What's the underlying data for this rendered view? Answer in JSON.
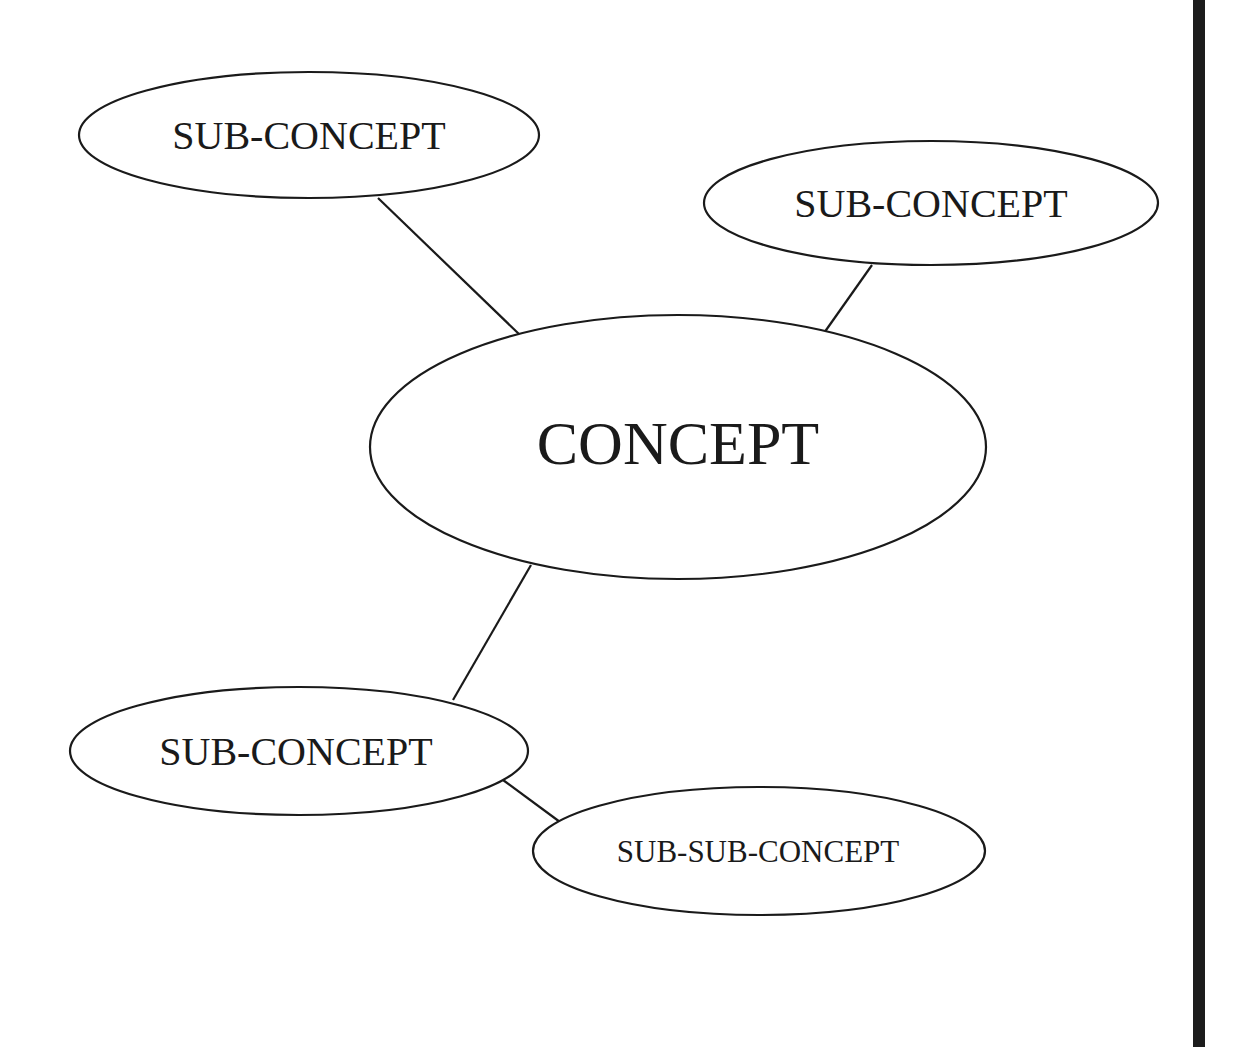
{
  "diagram": {
    "type": "concept-map",
    "colors": {
      "stroke": "#1a1a1a",
      "fill": "#ffffff",
      "background": "#ffffff",
      "right_bar": "#1c1c1c"
    },
    "nodes": [
      {
        "id": "concept",
        "label": "CONCEPT",
        "level": 0
      },
      {
        "id": "sub1",
        "label": "SUB-CONCEPT",
        "level": 1,
        "position": "top-left"
      },
      {
        "id": "sub2",
        "label": "SUB-CONCEPT",
        "level": 1,
        "position": "top-right"
      },
      {
        "id": "sub3",
        "label": "SUB-CONCEPT",
        "level": 1,
        "position": "bottom-left"
      },
      {
        "id": "subsub1",
        "label": "SUB-SUB-CONCEPT",
        "level": 2,
        "position": "bottom-right"
      }
    ],
    "edges": [
      {
        "from": "sub1",
        "to": "concept"
      },
      {
        "from": "sub2",
        "to": "concept"
      },
      {
        "from": "concept",
        "to": "sub3"
      },
      {
        "from": "sub3",
        "to": "subsub1"
      }
    ]
  }
}
